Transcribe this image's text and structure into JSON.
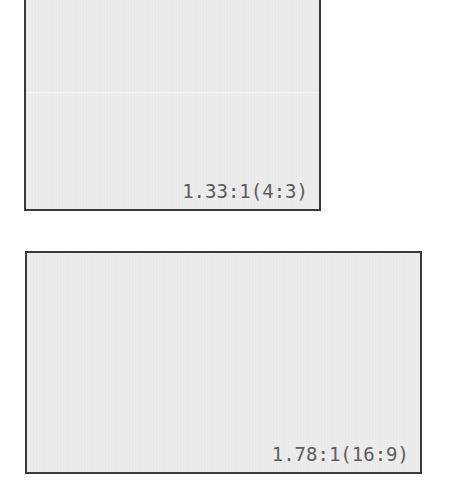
{
  "diagram": {
    "background_color": "#ffffff",
    "box_fill_color": "#ededed",
    "box_border_color": "#3a3a3a",
    "label_color": "#5d5d5d",
    "boxes": [
      {
        "id": "4-3",
        "label": "1.33:1(4:3)",
        "ratio_decimal": "1.33:1",
        "ratio_fraction": "4:3",
        "width_px": 297,
        "height_px": 215
      },
      {
        "id": "16-9",
        "label": "1.78:1(16:9)",
        "ratio_decimal": "1.78:1",
        "ratio_fraction": "16:9",
        "width_px": 397,
        "height_px": 223
      }
    ]
  }
}
